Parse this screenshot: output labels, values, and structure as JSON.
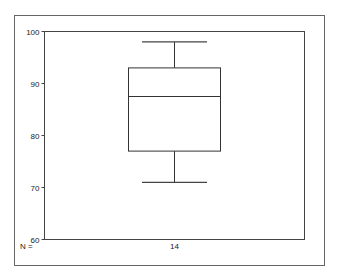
{
  "chart_data": {
    "type": "boxplot",
    "title": "",
    "xlabel": "",
    "ylabel": "",
    "ylim": [
      60,
      100
    ],
    "yticks": [
      60,
      70,
      80,
      90,
      100
    ],
    "grid": false,
    "legend": null,
    "n_label": "N =",
    "series": [
      {
        "name": "",
        "n": 14,
        "whisker_low": 71,
        "q1": 77,
        "median": 87.5,
        "q3": 93,
        "whisker_high": 98
      }
    ]
  },
  "colors": {
    "frame": "#555555",
    "axis": "#333333",
    "box": "#333333",
    "background": "#ffffff"
  }
}
